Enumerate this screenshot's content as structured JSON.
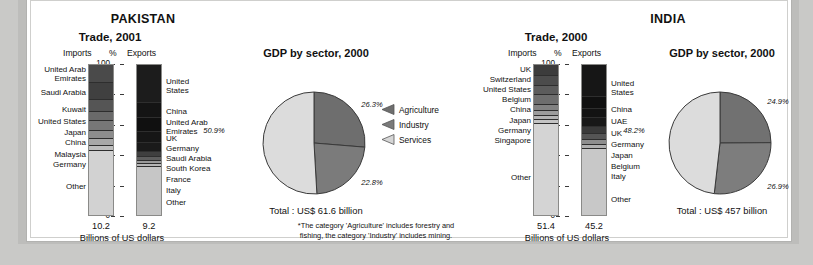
{
  "footnote": "*The category 'Agriculture' includes forestry and\nfishing, the category 'Industry' includes mining.",
  "footnote_line1": "*The category 'Agriculture' includes forestry and",
  "footnote_line2": "fishing, the category 'Industry' includes mining.",
  "legend": {
    "items": [
      {
        "label": "Agriculture",
        "color": "#6e6e6e",
        "icon": "triangle-left-icon"
      },
      {
        "label": "Industry",
        "color": "#7a7a7a",
        "icon": "triangle-left-icon"
      },
      {
        "label": "Services",
        "color": "#d6d6d6",
        "icon": "triangle-left-icon"
      }
    ]
  },
  "panels": [
    {
      "country": "PAKISTAN",
      "trade": {
        "title": "Trade, 2001",
        "imports_header": "Imports",
        "percent_header": "%",
        "exports_header": "Exports",
        "axis_ticks": [
          "100",
          "80",
          "60",
          "40",
          "20",
          "0"
        ],
        "axis_values": [
          100,
          80,
          60,
          40,
          20,
          0
        ],
        "units_label": "Billions of US dollars",
        "imports": {
          "total": "10.2",
          "segments": [
            {
              "label": "United Arab\nEmirates",
              "label_lines": [
                "United Arab",
                "Emirates"
              ],
              "pct": 12.0,
              "color": "#4a4a4a"
            },
            {
              "label": "Saudi Arabia",
              "label_lines": [
                "Saudi Arabia"
              ],
              "pct": 11.0,
              "color": "#404040"
            },
            {
              "label": "Kuwait",
              "label_lines": [
                "Kuwait"
              ],
              "pct": 8.0,
              "color": "#555555"
            },
            {
              "label": "United States",
              "label_lines": [
                "United States"
              ],
              "pct": 6.0,
              "color": "#6a6a6a"
            },
            {
              "label": "Japan",
              "label_lines": [
                "Japan"
              ],
              "pct": 6.5,
              "color": "#777777"
            },
            {
              "label": "China",
              "label_lines": [
                "China"
              ],
              "pct": 5.5,
              "color": "#8d8d8d"
            },
            {
              "label": "Malaysia",
              "label_lines": [
                "Malaysia"
              ],
              "pct": 4.0,
              "color": "#a8a8a8"
            },
            {
              "label": "Germany",
              "label_lines": [
                "Germany"
              ],
              "pct": 3.5,
              "color": "#bdbdbd"
            },
            {
              "label": "Other",
              "label_lines": [
                "Other"
              ],
              "pct": 43.5,
              "color": "#d2d2d2"
            }
          ]
        },
        "exports": {
          "total": "9.2",
          "segments": [
            {
              "label": "United\nStates",
              "label_lines": [
                "United",
                "States"
              ],
              "pct": 25.0,
              "color": "#1c1c1c"
            },
            {
              "label": "China",
              "label_lines": [
                "China"
              ],
              "pct": 10.0,
              "color": "#141414"
            },
            {
              "label": "United Arab\nEmirates",
              "label_lines": [
                "United Arab",
                "Emirates"
              ],
              "pct": 9.0,
              "color": "#101010"
            },
            {
              "label": "UK",
              "label_lines": [
                "UK"
              ],
              "pct": 7.0,
              "color": "#161616"
            },
            {
              "label": "Germany",
              "label_lines": [
                "Germany"
              ],
              "pct": 6.0,
              "color": "#1a1a1a"
            },
            {
              "label": "Saudi Arabia",
              "label_lines": [
                "Saudi Arabia"
              ],
              "pct": 3.5,
              "color": "#3f3f3f"
            },
            {
              "label": "South Korea",
              "label_lines": [
                "South Korea"
              ],
              "pct": 2.5,
              "color": "#5e5e5e"
            },
            {
              "label": "France",
              "label_lines": [
                "France"
              ],
              "pct": 2.0,
              "color": "#9a9a9a"
            },
            {
              "label": "Italy",
              "label_lines": [
                "Italy"
              ],
              "pct": 2.0,
              "color": "#b6b6b6"
            },
            {
              "label": "Other",
              "label_lines": [
                "Other"
              ],
              "pct": 33.0,
              "color": "#c6c6c6"
            }
          ]
        }
      },
      "gdp": {
        "title": "GDP by sector, 2000",
        "total": "Total : US$ 61.6 billion",
        "slices": [
          {
            "name": "Agriculture",
            "pct_label": "26.3%",
            "value": 26.3,
            "color": "#6e6e6e"
          },
          {
            "name": "Industry",
            "pct_label": "22.8%",
            "value": 22.8,
            "color": "#7b7b7b"
          },
          {
            "name": "Services",
            "pct_label": "50.9%",
            "value": 50.9,
            "color": "#dcdcdc"
          }
        ]
      }
    },
    {
      "country": "INDIA",
      "trade": {
        "title": "Trade, 2000",
        "imports_header": "Imports",
        "percent_header": "%",
        "exports_header": "Exports",
        "axis_ticks": [
          "100",
          "80",
          "60",
          "40",
          "20",
          "0"
        ],
        "axis_values": [
          100,
          80,
          60,
          40,
          20,
          0
        ],
        "units_label": "Billions of US dollars",
        "imports": {
          "total": "51.4",
          "segments": [
            {
              "label": "UK",
              "label_lines": [
                "UK"
              ],
              "pct": 7.0,
              "color": "#3c3c3c"
            },
            {
              "label": "Switzerland",
              "label_lines": [
                "Switzerland"
              ],
              "pct": 6.5,
              "color": "#4c4c4c"
            },
            {
              "label": "United States",
              "label_lines": [
                "United States"
              ],
              "pct": 6.5,
              "color": "#5c5c5c"
            },
            {
              "label": "Belgium",
              "label_lines": [
                "Belgium"
              ],
              "pct": 6.0,
              "color": "#6e6e6e"
            },
            {
              "label": "China",
              "label_lines": [
                "China"
              ],
              "pct": 4.0,
              "color": "#828282"
            },
            {
              "label": "Japan",
              "label_lines": [
                "Japan"
              ],
              "pct": 3.5,
              "color": "#9c9c9c"
            },
            {
              "label": "Germany",
              "label_lines": [
                "Germany"
              ],
              "pct": 3.0,
              "color": "#b4b4b4"
            },
            {
              "label": "Singapore",
              "label_lines": [
                "Singapore"
              ],
              "pct": 2.5,
              "color": "#c4c4c4"
            },
            {
              "label": "Other",
              "label_lines": [
                "Other"
              ],
              "pct": 61.0,
              "color": "#d4d4d4"
            }
          ]
        },
        "exports": {
          "total": "45.2",
          "segments": [
            {
              "label": "United\nStates",
              "label_lines": [
                "United",
                "States"
              ],
              "pct": 21.0,
              "color": "#161616"
            },
            {
              "label": "China",
              "label_lines": [
                "China"
              ],
              "pct": 8.0,
              "color": "#101010"
            },
            {
              "label": "UAE",
              "label_lines": [
                "UAE"
              ],
              "pct": 6.0,
              "color": "#131313"
            },
            {
              "label": "UK",
              "label_lines": [
                "UK"
              ],
              "pct": 5.5,
              "color": "#181818"
            },
            {
              "label": "Germany",
              "label_lines": [
                "Germany"
              ],
              "pct": 5.0,
              "color": "#3a3a3a"
            },
            {
              "label": "Japan",
              "label_lines": [
                "Japan"
              ],
              "pct": 4.0,
              "color": "#555555"
            },
            {
              "label": "Belgium",
              "label_lines": [
                "Belgium"
              ],
              "pct": 3.0,
              "color": "#8e8e8e"
            },
            {
              "label": "Italy",
              "label_lines": [
                "Italy"
              ],
              "pct": 2.5,
              "color": "#b0b0b0"
            },
            {
              "label": "Other",
              "label_lines": [
                "Other"
              ],
              "pct": 45.0,
              "color": "#c8c8c8"
            }
          ]
        }
      },
      "gdp": {
        "title": "GDP by sector, 2000",
        "total": "Total : US$ 457 billion",
        "slices": [
          {
            "name": "Agriculture",
            "pct_label": "24.9%",
            "value": 24.9,
            "color": "#717171"
          },
          {
            "name": "Industry",
            "pct_label": "26.9%",
            "value": 26.9,
            "color": "#7d7d7d"
          },
          {
            "name": "Services",
            "pct_label": "48.2%",
            "value": 48.2,
            "color": "#dcdcdc"
          }
        ]
      }
    }
  ],
  "chart_data": [
    {
      "type": "bar",
      "title": "Pakistan Trade, 2001 — Imports (stacked 100%)",
      "ylabel": "%",
      "ylim": [
        0,
        100
      ],
      "categories": [
        "United Arab Emirates",
        "Saudi Arabia",
        "Kuwait",
        "United States",
        "Japan",
        "China",
        "Malaysia",
        "Germany",
        "Other"
      ],
      "values": [
        12.0,
        11.0,
        8.0,
        6.0,
        6.5,
        5.5,
        4.0,
        3.5,
        43.5
      ],
      "total_label": "10.2",
      "units": "Billions of US dollars"
    },
    {
      "type": "bar",
      "title": "Pakistan Trade, 2001 — Exports (stacked 100%)",
      "ylabel": "%",
      "ylim": [
        0,
        100
      ],
      "categories": [
        "United States",
        "China",
        "United Arab Emirates",
        "UK",
        "Germany",
        "Saudi Arabia",
        "South Korea",
        "France",
        "Italy",
        "Other"
      ],
      "values": [
        25.0,
        10.0,
        9.0,
        7.0,
        6.0,
        3.5,
        2.5,
        2.0,
        2.0,
        33.0
      ],
      "total_label": "9.2",
      "units": "Billions of US dollars"
    },
    {
      "type": "pie",
      "title": "Pakistan GDP by sector, 2000",
      "categories": [
        "Agriculture",
        "Industry",
        "Services"
      ],
      "values": [
        26.3,
        22.8,
        50.9
      ],
      "total_label": "Total : US$ 61.6 billion"
    },
    {
      "type": "bar",
      "title": "India Trade, 2000 — Imports (stacked 100%)",
      "ylabel": "%",
      "ylim": [
        0,
        100
      ],
      "categories": [
        "UK",
        "Switzerland",
        "United States",
        "Belgium",
        "China",
        "Japan",
        "Germany",
        "Singapore",
        "Other"
      ],
      "values": [
        7.0,
        6.5,
        6.5,
        6.0,
        4.0,
        3.5,
        3.0,
        2.5,
        61.0
      ],
      "total_label": "51.4",
      "units": "Billions of US dollars"
    },
    {
      "type": "bar",
      "title": "India Trade, 2000 — Exports (stacked 100%)",
      "ylabel": "%",
      "ylim": [
        0,
        100
      ],
      "categories": [
        "United States",
        "China",
        "UAE",
        "UK",
        "Germany",
        "Japan",
        "Belgium",
        "Italy",
        "Other"
      ],
      "values": [
        21.0,
        8.0,
        6.0,
        5.5,
        5.0,
        4.0,
        3.0,
        2.5,
        45.0
      ],
      "total_label": "45.2",
      "units": "Billions of US dollars"
    },
    {
      "type": "pie",
      "title": "India GDP by sector, 2000",
      "categories": [
        "Agriculture",
        "Industry",
        "Services"
      ],
      "values": [
        24.9,
        26.9,
        48.2
      ],
      "total_label": "Total : US$ 457 billion"
    }
  ]
}
